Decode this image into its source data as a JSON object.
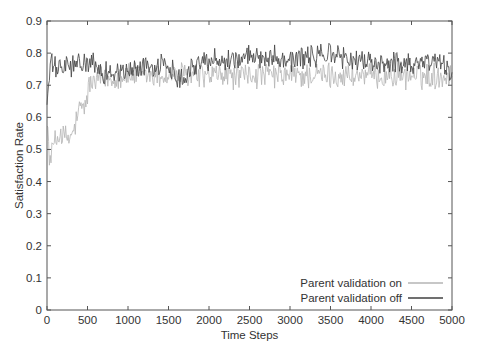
{
  "chart_data": {
    "type": "line",
    "title": "",
    "xlabel": "Time Steps",
    "ylabel": "Satisfaction Rate",
    "xlim": [
      0,
      5000
    ],
    "ylim": [
      0,
      0.9
    ],
    "x_ticks": [
      0,
      500,
      1000,
      1500,
      2000,
      2500,
      3000,
      3500,
      4000,
      4500,
      5000
    ],
    "x_tick_labels": [
      "0",
      "500",
      "1000",
      "1500",
      "2000",
      "2500",
      "3000",
      "3500",
      "4000",
      "4500",
      "5000"
    ],
    "y_ticks": [
      0,
      0.1,
      0.2,
      0.3,
      0.4,
      0.5,
      0.6,
      0.7,
      0.8,
      0.9
    ],
    "y_tick_labels": [
      "0",
      "0.1",
      "0.2",
      "0.3",
      "0.4",
      "0.5",
      "0.6",
      "0.7",
      "0.8",
      "0.9"
    ],
    "grid": false,
    "legend_position": "lower right",
    "series": [
      {
        "name": "Parent validation on",
        "color": "#b4b4b4",
        "noise": 0.035,
        "trend": {
          "x": [
            0,
            30,
            60,
            100,
            150,
            200,
            280,
            320,
            400,
            480,
            520,
            600,
            700,
            800,
            900,
            1000,
            1200,
            1500,
            2000,
            2500,
            3000,
            3500,
            4000,
            4500,
            5000
          ],
          "y": [
            0.62,
            0.45,
            0.5,
            0.52,
            0.55,
            0.54,
            0.53,
            0.55,
            0.62,
            0.64,
            0.7,
            0.71,
            0.72,
            0.72,
            0.73,
            0.73,
            0.73,
            0.73,
            0.73,
            0.73,
            0.73,
            0.73,
            0.73,
            0.73,
            0.73
          ]
        }
      },
      {
        "name": "Parent validation off",
        "color": "#404040",
        "noise": 0.03,
        "trend": {
          "x": [
            0,
            50,
            100,
            300,
            500,
            700,
            900,
            1000,
            1200,
            1500,
            1650,
            1800,
            2000,
            2300,
            2600,
            2800,
            3000,
            3300,
            3500,
            3700,
            4000,
            4300,
            4600,
            4800,
            5000
          ],
          "y": [
            0.65,
            0.77,
            0.75,
            0.76,
            0.77,
            0.74,
            0.74,
            0.74,
            0.76,
            0.76,
            0.72,
            0.76,
            0.78,
            0.78,
            0.79,
            0.79,
            0.78,
            0.79,
            0.8,
            0.78,
            0.77,
            0.77,
            0.77,
            0.78,
            0.74
          ]
        }
      }
    ]
  },
  "legend": {
    "items": [
      {
        "label": "Parent validation on",
        "color": "#b4b4b4"
      },
      {
        "label": "Parent validation off",
        "color": "#404040"
      }
    ]
  }
}
